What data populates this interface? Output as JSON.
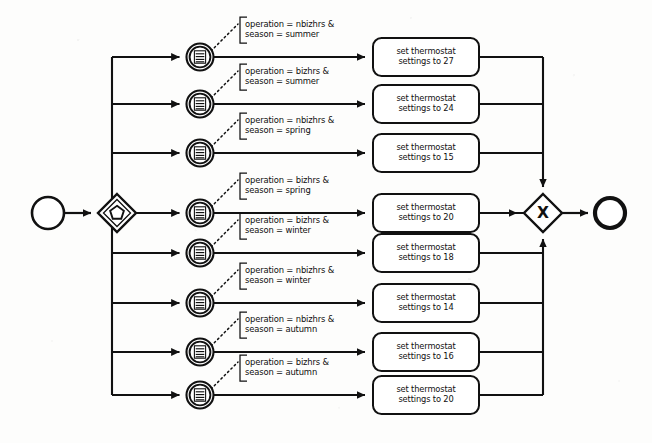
{
  "diagram": {
    "notation": "BPMN",
    "colors": {
      "stroke": "#111111",
      "fill": "#ffffff",
      "background": "#fdfdfc"
    },
    "start_event": {
      "name": "start-event",
      "label": ""
    },
    "end_event": {
      "name": "end-event",
      "label": ""
    },
    "split_gateway": {
      "name": "complex-gateway",
      "symbol": "pentagon",
      "label": ""
    },
    "join_gateway": {
      "name": "exclusive-gateway",
      "symbol": "X",
      "label": "X"
    },
    "branches": [
      {
        "index": 1,
        "event_type": "conditional-intermediate-event",
        "condition_line1": "operation = nbizhrs &",
        "condition_line2": "season = summer",
        "task_line1": "set thermostat",
        "task_line2": "settings to 27",
        "temperature": 27,
        "operation": "nbizhrs",
        "season": "summer"
      },
      {
        "index": 2,
        "event_type": "conditional-intermediate-event",
        "condition_line1": "operation = bizhrs &",
        "condition_line2": "season = summer",
        "task_line1": "set thermostat",
        "task_line2": "settings to 24",
        "temperature": 24,
        "operation": "bizhrs",
        "season": "summer"
      },
      {
        "index": 3,
        "event_type": "conditional-intermediate-event",
        "condition_line1": "operation = nbizhrs &",
        "condition_line2": "season = spring",
        "task_line1": "set thermostat",
        "task_line2": "settings to 15",
        "temperature": 15,
        "operation": "nbizhrs",
        "season": "spring"
      },
      {
        "index": 4,
        "event_type": "conditional-intermediate-event",
        "condition_line1": "operation = bizhrs &",
        "condition_line2": "season = spring",
        "task_line1": "set thermostat",
        "task_line2": "settings to 20",
        "temperature": 20,
        "operation": "bizhrs",
        "season": "spring"
      },
      {
        "index": 5,
        "event_type": "conditional-intermediate-event",
        "condition_line1": "operation = bizhrs &",
        "condition_line2": "season = winter",
        "task_line1": "set thermostat",
        "task_line2": "settings to 18",
        "temperature": 18,
        "operation": "bizhrs",
        "season": "winter"
      },
      {
        "index": 6,
        "event_type": "conditional-intermediate-event",
        "condition_line1": "operation = nbizhrs &",
        "condition_line2": "season = winter",
        "task_line1": "set thermostat",
        "task_line2": "settings to 14",
        "temperature": 14,
        "operation": "nbizhrs",
        "season": "winter"
      },
      {
        "index": 7,
        "event_type": "conditional-intermediate-event",
        "condition_line1": "operation = nbizhrs &",
        "condition_line2": "season = autumn",
        "task_line1": "set thermostat",
        "task_line2": "settings to 16",
        "temperature": 16,
        "operation": "nbizhrs",
        "season": "autumn"
      },
      {
        "index": 8,
        "event_type": "conditional-intermediate-event",
        "condition_line1": "operation = bizhrs &",
        "condition_line2": "season = autumn",
        "task_line1": "set thermostat",
        "task_line2": "settings to 20",
        "temperature": 20,
        "operation": "bizhrs",
        "season": "autumn"
      }
    ]
  }
}
